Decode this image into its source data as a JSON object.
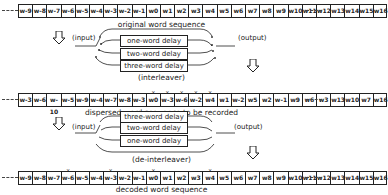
{
  "original": {
    "caption": "original word sequence",
    "cells": [
      "w-9",
      "w-8",
      "w-7",
      "w-6",
      "w-5",
      "w-4",
      "w-3",
      "w-2",
      "w-1",
      "w0",
      "w1",
      "w2",
      "w3",
      "w4",
      "w5",
      "w6",
      "w7",
      "w8",
      "w9",
      "w10",
      "w11",
      "w12",
      "w13",
      "w14",
      "w15",
      "w16"
    ]
  },
  "interleaver": {
    "input_label": "(input)",
    "output_label": "(output)",
    "caption": "(interleaver)",
    "delays": [
      "one-word delay",
      "two-word delay",
      "three-word delay"
    ]
  },
  "dispersed": {
    "caption": "dispersed word sequence to be recorded",
    "cells": [
      "w-3",
      "w-6",
      "w-10",
      "w-5",
      "w-9",
      "w-4",
      "w-7",
      "w-8",
      "w-3",
      "w0",
      "w-3",
      "w-6",
      "w-2",
      "w4",
      "w1",
      "w-2",
      "w5",
      "w2",
      "w-1",
      "w9",
      "w6",
      "w3",
      "w13",
      "w10",
      "w7",
      "w16"
    ],
    "marks": [
      9,
      10,
      11,
      12,
      13
    ]
  },
  "deinterleaver": {
    "input_label": "(input)",
    "output_label": "(output)",
    "caption": "(de-interleaver)",
    "delays": [
      "three-word delay",
      "two-word delay",
      "one-word delay"
    ]
  },
  "decoded": {
    "caption": "decoded word sequence",
    "cells": [
      "w-9",
      "w-8",
      "w-7",
      "w-6",
      "w-5",
      "w-4",
      "w-3",
      "w-2",
      "w-1",
      "w0",
      "w1",
      "w2",
      "w3",
      "w4",
      "w5",
      "w6",
      "w7",
      "w8",
      "w9",
      "w10",
      "w11",
      "w12",
      "w13",
      "w14",
      "w15",
      "w16"
    ],
    "marks": [
      3,
      6,
      9,
      13
    ]
  }
}
